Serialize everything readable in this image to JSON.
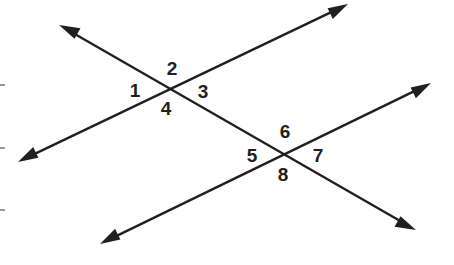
{
  "diagram": {
    "colors": {
      "line": "#231f20",
      "label": "#231f20",
      "background": "#ffffff",
      "tick": "#555555"
    },
    "lines": [
      {
        "id": "transversal",
        "from": [
          59,
          25
        ],
        "to": [
          416,
          230
        ],
        "arrows": "both"
      },
      {
        "id": "parallel-upper",
        "from": [
          18,
          162
        ],
        "to": [
          348,
          4
        ],
        "arrows": "both"
      },
      {
        "id": "parallel-lower",
        "from": [
          100,
          244
        ],
        "to": [
          431,
          83
        ],
        "arrows": "both"
      }
    ],
    "intersections": [
      {
        "id": "upper",
        "point": [
          170,
          89
        ]
      },
      {
        "id": "lower",
        "point": [
          283,
          153
        ]
      }
    ],
    "angles": [
      {
        "label": "1",
        "x": 135,
        "y": 97
      },
      {
        "label": "2",
        "x": 172,
        "y": 75
      },
      {
        "label": "3",
        "x": 203,
        "y": 98
      },
      {
        "label": "4",
        "x": 166,
        "y": 115
      },
      {
        "label": "5",
        "x": 252,
        "y": 162
      },
      {
        "label": "6",
        "x": 285,
        "y": 138
      },
      {
        "label": "7",
        "x": 318,
        "y": 162
      },
      {
        "label": "8",
        "x": 283,
        "y": 181
      }
    ],
    "margin_ticks": [
      85,
      148,
      210
    ]
  }
}
